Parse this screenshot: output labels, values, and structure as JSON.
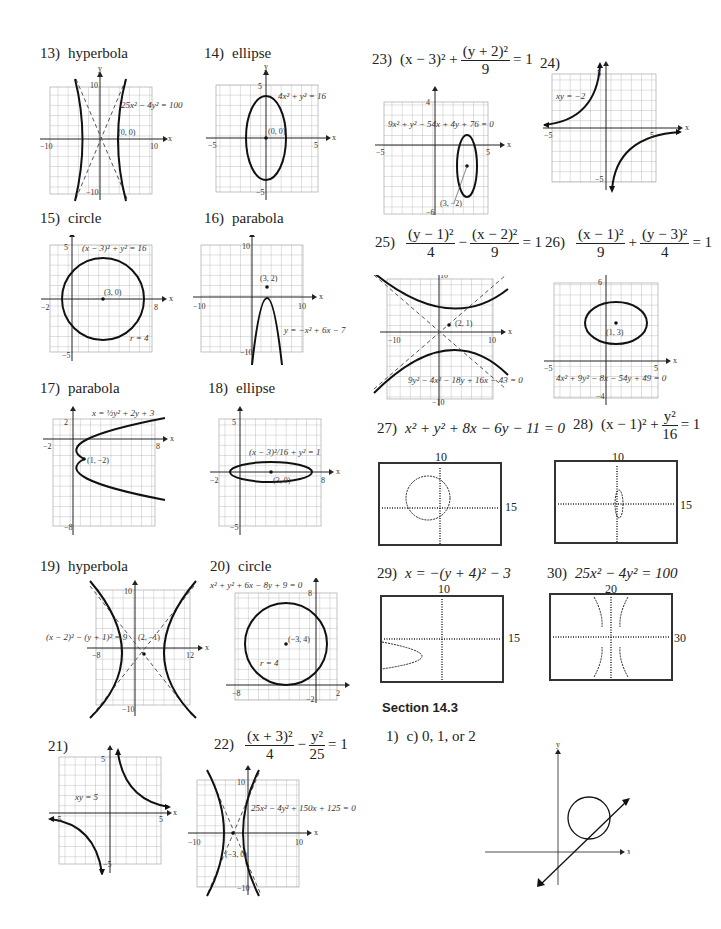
{
  "problems": {
    "p13": {
      "num": "13)",
      "label": "hyperbola",
      "equation": "25x² − 4y² = 100",
      "point": "(0, 0)",
      "ticks": {
        "xmin": "−10",
        "xmax": "10",
        "ymax": "10",
        "ymin": "−10"
      }
    },
    "p14": {
      "num": "14)",
      "label": "ellipse",
      "equation": "4x² + y² = 16",
      "point": "(0, 0)",
      "ticks": {
        "xmin": "−5",
        "xmax": "5",
        "ymax": "5",
        "ymin": "−5"
      }
    },
    "p15": {
      "num": "15)",
      "label": "circle",
      "equation": "(x − 3)² + y² = 16",
      "point": "(3, 0)",
      "radius": "r = 4",
      "ticks": {
        "xmin": "−2",
        "xmax": "8",
        "ymax": "5",
        "ymin": "−5"
      }
    },
    "p16": {
      "num": "16)",
      "label": "parabola",
      "equation": "y = −x² + 6x − 7",
      "point": "(3, 2)",
      "ticks": {
        "xmin": "−10",
        "xmax": "10",
        "ymax": "10",
        "ymin": "−10"
      }
    },
    "p17": {
      "num": "17)",
      "label": "parabola",
      "equation": "x = ½y² + 2y + 3",
      "point": "(1, −2)",
      "ticks": {
        "xmin": "−2",
        "xmax": "8",
        "ymax": "2",
        "ymin": "−8"
      }
    },
    "p18": {
      "num": "18)",
      "label": "ellipse",
      "equation": "(x − 3)²/16 + y² = 1",
      "point": "(3, 0)",
      "ticks": {
        "xmin": "−2",
        "xmax": "8",
        "ymax": "5",
        "ymin": "−5"
      }
    },
    "p19": {
      "num": "19)",
      "label": "hyperbola",
      "equation": "(x − 2)² − (y + 1)² = 9",
      "point": "(2, −1)",
      "ticks": {
        "xmin": "−8",
        "xmax": "12",
        "ymax": "10",
        "ymin": "−10"
      }
    },
    "p20": {
      "num": "20)",
      "label": "circle",
      "equation": "x² + y² + 6x − 8y + 9 = 0",
      "point": "(−3, 4)",
      "radius": "r = 4",
      "ticks": {
        "xmin": "−8",
        "xmax": "2",
        "ymax": "8",
        "ymin": "−2"
      }
    },
    "p21": {
      "num": "21)",
      "label": "",
      "equation": "xy = 5",
      "ticks": {
        "xmin": "−5",
        "xmax": "5",
        "ymax": "5",
        "ymin": "−5"
      }
    },
    "p22": {
      "num": "22)",
      "title_num1": "(x + 3)²",
      "title_den1": "4",
      "title_minus": "−",
      "title_num2": "y²",
      "title_den2": "25",
      "title_rhs": "= 1",
      "equation": "25x² − 4y² + 150x + 125 = 0",
      "point": "(−3, 0)",
      "ticks": {
        "xmin": "−10",
        "xmax": "10",
        "ymax": "10",
        "ymin": "−10"
      }
    },
    "p23": {
      "num": "23)",
      "title_pre": "(x − 3)² +",
      "title_num": "(y + 2)²",
      "title_den": "9",
      "title_rhs": "= 1",
      "equation": "9x² + y² − 54x + 4y + 76 = 0",
      "point": "(3, −2)",
      "ticks": {
        "xmin": "−5",
        "xmax": "5",
        "ymax": "4",
        "ymin": "−6"
      }
    },
    "p24": {
      "num": "24)",
      "equation": "xy = −2",
      "ticks": {
        "xmin": "−5",
        "xmax": "5",
        "ymax": "5",
        "ymin": "−5"
      }
    },
    "p25": {
      "num": "25)",
      "title_num1": "(y − 1)²",
      "title_den1": "4",
      "title_minus": "−",
      "title_num2": "(x − 2)²",
      "title_den2": "9",
      "title_rhs": "= 1",
      "equation": "9y² − 4x² − 18y + 16x − 43 = 0",
      "point": "(2, 1)",
      "ticks": {
        "xmin": "−10",
        "xmax": "10",
        "ymax": "10",
        "ymin": "−10"
      }
    },
    "p26": {
      "num": "26)",
      "title_num1": "(x − 1)²",
      "title_den1": "9",
      "title_plus": "+",
      "title_num2": "(y − 3)²",
      "title_den2": "4",
      "title_rhs": "= 1",
      "equation": "4x² + 9y² − 8x − 54y + 49 = 0",
      "point": "(1, 3)",
      "ticks": {
        "xmin": "−5",
        "xmax": "5",
        "ymax": "6",
        "ymin": "−4"
      }
    },
    "p27": {
      "num": "27)",
      "title": "x² + y² + 8x − 6y − 11 = 0",
      "win_y": "10",
      "win_x": "15"
    },
    "p28": {
      "num": "28)",
      "title_pre": "(x − 1)² +",
      "title_num": "y²",
      "title_den": "16",
      "title_rhs": "= 1",
      "win_y": "10",
      "win_x": "15"
    },
    "p29": {
      "num": "29)",
      "title": "x = −(y + 4)² − 3",
      "win_y": "10",
      "win_x": "15"
    },
    "p30": {
      "num": "30)",
      "title": "25x² − 4y² = 100",
      "win_y": "20",
      "win_x": "30"
    }
  },
  "section": {
    "title": "Section 14.3",
    "answer_num": "1)",
    "answer": "c) 0, 1, or 2"
  },
  "axis_labels": {
    "x": "x",
    "y": "y"
  }
}
